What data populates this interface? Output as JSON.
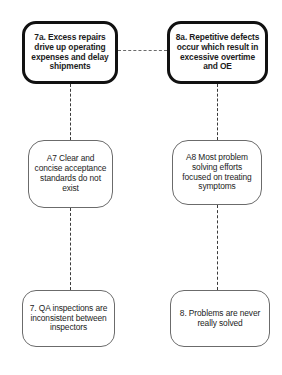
{
  "diagram": {
    "type": "current-reality-tree",
    "background_color": "#ffffff",
    "nodes": [
      {
        "id": "7a",
        "role": "effect",
        "label": "7a. Excess repairs drive up operating expenses and delay shipments",
        "border_color": "#111111",
        "border_style": "thick-rounded"
      },
      {
        "id": "8a",
        "role": "effect",
        "label": "8a. Repetitive defects occur which result in excessive overtime and OE",
        "border_color": "#111111",
        "border_style": "thick-rounded"
      },
      {
        "id": "A7",
        "role": "assumption",
        "label": "A7 Clear and concise acceptance standards do not exist",
        "border_color": "#6b6b6b",
        "border_style": "thin-rounded"
      },
      {
        "id": "A8",
        "role": "assumption",
        "label": "A8 Most problem solving efforts focused on treating symptoms",
        "border_color": "#6b6b6b",
        "border_style": "thin-rounded"
      },
      {
        "id": "7",
        "role": "cause",
        "label": "7. QA inspections are inconsistent between inspectors",
        "border_color": "#6b6b6b",
        "border_style": "thin-rounded"
      },
      {
        "id": "8",
        "role": "cause",
        "label": "8. Problems are never really solved",
        "border_color": "#6b6b6b",
        "border_style": "thin-rounded"
      }
    ],
    "connectors": [
      {
        "id": "7a-8a",
        "from": "7a",
        "to": "8a",
        "orientation": "horizontal",
        "style": "dashed"
      },
      {
        "id": "7a-a7",
        "from": "7a",
        "to": "A7",
        "orientation": "vertical",
        "style": "dashed"
      },
      {
        "id": "8a-a8",
        "from": "8a",
        "to": "A8",
        "orientation": "vertical",
        "style": "dashed"
      },
      {
        "id": "a7-7",
        "from": "A7",
        "to": "7",
        "orientation": "vertical",
        "style": "dashed"
      },
      {
        "id": "a8-8",
        "from": "A8",
        "to": "8",
        "orientation": "vertical",
        "style": "dashed"
      }
    ]
  }
}
